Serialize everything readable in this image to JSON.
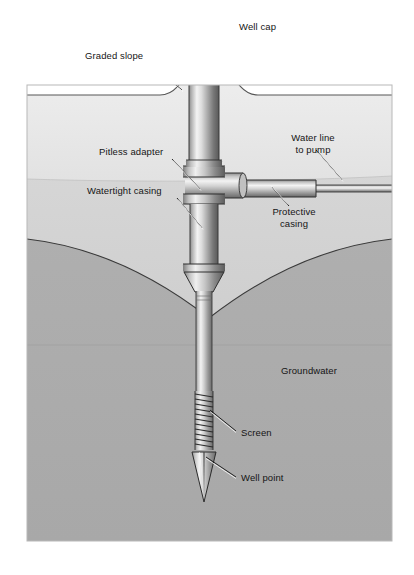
{
  "figure": {
    "kind": "technical-illustration",
    "frame": {
      "x": 27,
      "y": 85,
      "width": 365,
      "height": 456
    },
    "colors": {
      "page_background": "#ffffff",
      "sky_background": "#ffffff",
      "upper_soil": "#e9e9e9",
      "mid_soil": "#d2d2d2",
      "groundwater_zone": "#adadad",
      "outline": "#2a2a2a",
      "metal_light": "#f2f2f2",
      "metal_mid": "#b4b4b4",
      "metal_dark": "#6f6f6f",
      "label_text": "#151515",
      "leader_line": "#1a1a1a"
    },
    "ground_surface_y": 95,
    "water_table_label": "Groundwater"
  },
  "labels": [
    {
      "id": "well-cap",
      "text": "Well cap",
      "x": 239,
      "y": 27,
      "align": "left"
    },
    {
      "id": "graded-slope",
      "text": "Graded slope",
      "x": 85,
      "y": 56,
      "align": "left"
    },
    {
      "id": "water-line",
      "text": "Water line\nto pump",
      "x": 313,
      "y": 138,
      "align": "center"
    },
    {
      "id": "pitless-adapter",
      "text": "Pitless adapter",
      "x": 99,
      "y": 152,
      "align": "left"
    },
    {
      "id": "watertight-casing",
      "text": "Watertight casing",
      "x": 87,
      "y": 191,
      "align": "left"
    },
    {
      "id": "protective-casing",
      "text": "Protective\ncasing",
      "x": 294,
      "y": 212,
      "align": "center"
    },
    {
      "id": "groundwater",
      "text": "Groundwater",
      "x": 309,
      "y": 371,
      "align": "center"
    },
    {
      "id": "screen",
      "text": "Screen",
      "x": 241,
      "y": 433,
      "align": "left"
    },
    {
      "id": "well-point",
      "text": "Well point",
      "x": 241,
      "y": 478,
      "align": "left"
    }
  ],
  "leader_lines": [
    {
      "id": "leader-well-cap",
      "from": [
        236,
        31
      ],
      "to": [
        214,
        51
      ]
    },
    {
      "id": "leader-graded-slope",
      "from": [
        144,
        60
      ],
      "to": [
        182,
        90
      ]
    },
    {
      "id": "leader-water-line",
      "from": [
        316,
        150
      ],
      "to": [
        342,
        180
      ]
    },
    {
      "id": "leader-pitless-adapter",
      "from": [
        172,
        159
      ],
      "to": [
        200,
        189
      ]
    },
    {
      "id": "leader-watertight-casing",
      "from": [
        177,
        198
      ],
      "to": [
        202,
        228
      ]
    },
    {
      "id": "leader-protective-casing",
      "from": [
        289,
        206
      ],
      "to": [
        272,
        187
      ]
    },
    {
      "id": "leader-screen",
      "from": [
        236,
        431
      ],
      "to": [
        210,
        410
      ]
    },
    {
      "id": "leader-well-point",
      "from": [
        236,
        477
      ],
      "to": [
        206,
        457
      ]
    }
  ],
  "components": [
    {
      "id": "well-cap",
      "name": "Well cap",
      "description": "Domed metal cap over the casing above grade"
    },
    {
      "id": "watertight-casing",
      "name": "Watertight casing",
      "description": "Vertical steel casing running from cap down past the water table"
    },
    {
      "id": "pitless-adapter",
      "name": "Pitless adapter",
      "description": "Horizontal fitting joining casing to buried water line"
    },
    {
      "id": "protective-casing",
      "name": "Protective casing",
      "description": "Sleeve around the water line just outside the well"
    },
    {
      "id": "water-line",
      "name": "Water line to pump",
      "description": "Buried pipe leading off to the right toward the pump"
    },
    {
      "id": "screen",
      "name": "Screen",
      "description": "Slotted intake section near the bottom of the drive pipe"
    },
    {
      "id": "well-point",
      "name": "Well point",
      "description": "Pointed drive tip at the very bottom"
    },
    {
      "id": "graded-slope",
      "name": "Graded slope",
      "description": "Earth mounded and sloped away from the casing at the surface"
    },
    {
      "id": "groundwater",
      "name": "Groundwater",
      "description": "Saturated zone below the cone of depression"
    }
  ]
}
